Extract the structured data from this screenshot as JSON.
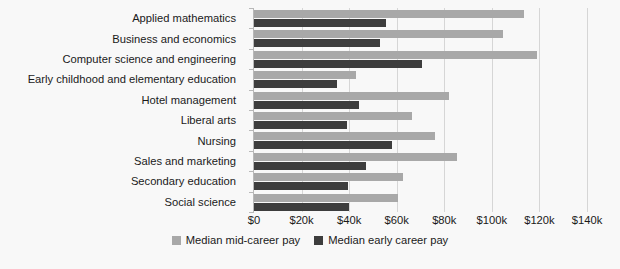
{
  "chart_data": {
    "type": "bar",
    "orientation": "horizontal",
    "title": "",
    "xlabel": "",
    "ylabel": "",
    "xlim": [
      0,
      140000
    ],
    "xticks": [
      0,
      20000,
      40000,
      60000,
      80000,
      100000,
      120000,
      140000
    ],
    "xtick_labels": [
      "$0",
      "$20k",
      "$40k",
      "$60k",
      "$80k",
      "$100k",
      "$120k",
      "$140k"
    ],
    "grid": true,
    "legend_position": "bottom-center",
    "categories": [
      "Applied mathematics",
      "Business and economics",
      "Computer science and engineering",
      "Early childhood and elementary education",
      "Hotel management",
      "Liberal arts",
      "Nursing",
      "Sales and marketing",
      "Secondary education",
      "Social science"
    ],
    "series": [
      {
        "name": "Median mid-career pay",
        "color": "#a8a8a8",
        "values": [
          113500,
          104500,
          119000,
          43000,
          82000,
          66500,
          76000,
          85500,
          62500,
          60500
        ]
      },
      {
        "name": "Median early career pay",
        "color": "#3d3d3d",
        "values": [
          55500,
          53000,
          70500,
          35000,
          44000,
          39000,
          58000,
          47000,
          39500,
          40000
        ]
      }
    ]
  },
  "legend": {
    "items": [
      {
        "label": "Median mid-career pay",
        "color": "#a8a8a8"
      },
      {
        "label": "Median early career pay",
        "color": "#3d3d3d"
      }
    ]
  }
}
